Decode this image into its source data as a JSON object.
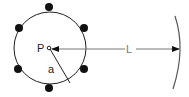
{
  "diagram": {
    "labels": {
      "center": "P",
      "radius": "a",
      "distance": "L"
    },
    "colors": {
      "circle": "#222222",
      "dots": "#111111",
      "line": "#777777",
      "arc": "#555555"
    },
    "dot_count": 6
  }
}
